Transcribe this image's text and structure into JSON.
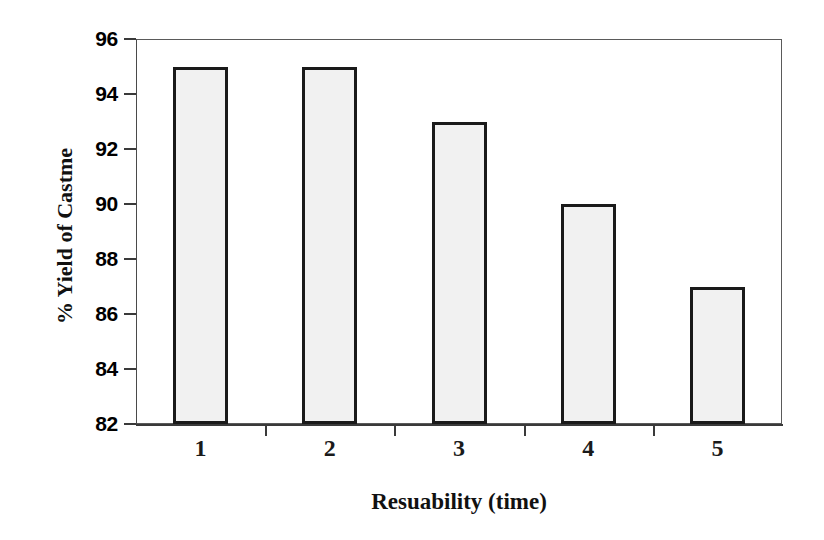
{
  "chart_data": {
    "type": "bar",
    "title": "",
    "categories": [
      "1",
      "2",
      "3",
      "4",
      "5"
    ],
    "values": [
      95,
      95,
      93,
      90,
      87
    ],
    "series": [
      {
        "name": "% Yield of Castme",
        "values": [
          95,
          95,
          93,
          90,
          87
        ]
      }
    ],
    "xlabel": "Resuability (time)",
    "ylabel": "% Yield of Castme",
    "ylim": [
      82,
      96
    ],
    "xlim": [
      0,
      5
    ],
    "ytick_labels": [
      "96",
      "94",
      "92",
      "90",
      "88",
      "86",
      "84",
      "82"
    ],
    "ytick_values": [
      96,
      94,
      92,
      90,
      88,
      86,
      84,
      82
    ],
    "ytick_step": 2,
    "grid": false,
    "legend": null,
    "legend_position": "none",
    "bar_fill_color": "#f1f1f1",
    "bar_edge_color": "#1a1a1a",
    "frame_color": "#5a5a5a",
    "background_color": "#ffffff",
    "text_color": "#000000",
    "annotations": []
  }
}
